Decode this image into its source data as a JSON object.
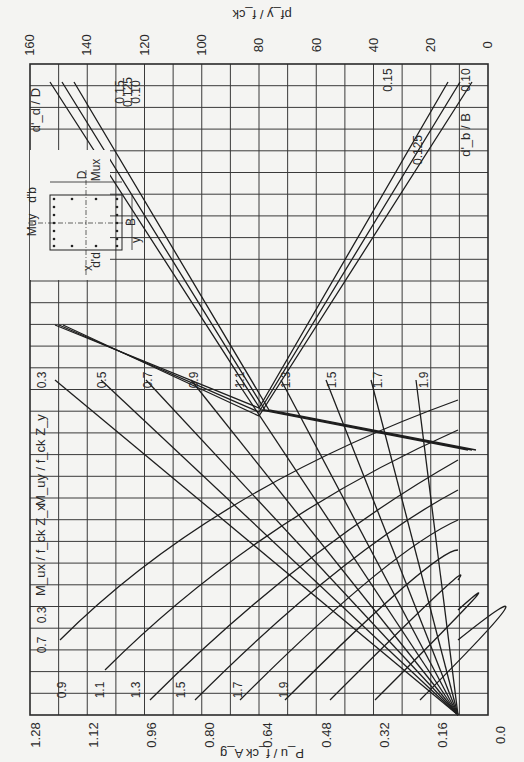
{
  "chart_data": {
    "type": "line",
    "orientation": "rotated 90 degrees (page turned)",
    "bottom_axis": {
      "label": "P_u / f_ck A_g",
      "ticks": [
        "1.28",
        "1.12",
        "0.96",
        "0.80",
        "0.64",
        "0.48",
        "0.32",
        "0.16",
        "0.0"
      ],
      "range": [
        1.28,
        0.0
      ]
    },
    "top_axis": {
      "label": "pf_y / f_ck",
      "ticks": [
        "160",
        "140",
        "120",
        "100",
        "80",
        "60",
        "40",
        "20",
        "0"
      ],
      "range": [
        160,
        0
      ]
    },
    "left_panel_labels": {
      "mux_label": "M_ux / f_ck Z_x",
      "muy_label": "M_uy / f_ck Z_y"
    },
    "series_mux": {
      "name": "M_ux / f_ck Z_x",
      "values": [
        "0.3",
        "0.5",
        "0.7",
        "0.9",
        "1.1",
        "1.3",
        "1.5",
        "1.7",
        "1.9"
      ],
      "visible_labels": [
        "0.3",
        "0.7",
        "0.9",
        "1.1",
        "1.3",
        "1.5",
        "1.7",
        "1.9"
      ]
    },
    "series_muy": {
      "name": "M_uy / f_ck Z_y",
      "values": [
        "0.3",
        "0.5",
        "0.7",
        "0.9",
        "1.1",
        "1.3",
        "1.5",
        "1.7",
        "1.9"
      ]
    },
    "series_dd": {
      "name": "d'_d / D",
      "values": [
        "0.15",
        "0.125",
        "0.10"
      ]
    },
    "series_db": {
      "name": "d'_b / B",
      "values": [
        "0.15",
        "0.125",
        "0.10"
      ]
    },
    "inset": {
      "labels": [
        "d'_b",
        "M_uy",
        "D",
        "M_ux",
        "B",
        "x",
        "y",
        "d'_d"
      ]
    },
    "grid": true
  },
  "axis_text": {
    "bottom_title": "P_u / f_ck A_g",
    "top_title": "pf_y / f_ck",
    "dd_title": "d'_d / D",
    "db_title": "d'_b / B",
    "mux_title": "M_ux / f_ck Z_x",
    "muy_title": "M_uy / f_ck Z_y"
  }
}
